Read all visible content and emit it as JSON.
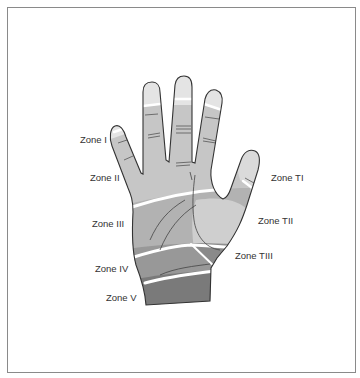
{
  "diagram": {
    "labels": {
      "zone_i": "Zone I",
      "zone_ii": "Zone II",
      "zone_iii": "Zone III",
      "zone_iv": "Zone IV",
      "zone_v": "Zone V",
      "zone_ti": "Zone TI",
      "zone_tii": "Zone TII",
      "zone_tiii": "Zone TIII"
    },
    "colors": {
      "zone_i": "#e6e6e6",
      "zone_ii": "#c8c8c8",
      "zone_iii": "#b4b4b4",
      "zone_iv": "#9a9a9a",
      "zone_v": "#7c7c7c",
      "zone_ti": "#dcdcdc",
      "zone_tii": "#cfcfcf",
      "zone_tiii": "#8c8c8c",
      "outline": "#333333",
      "divider": "#ffffff"
    }
  }
}
